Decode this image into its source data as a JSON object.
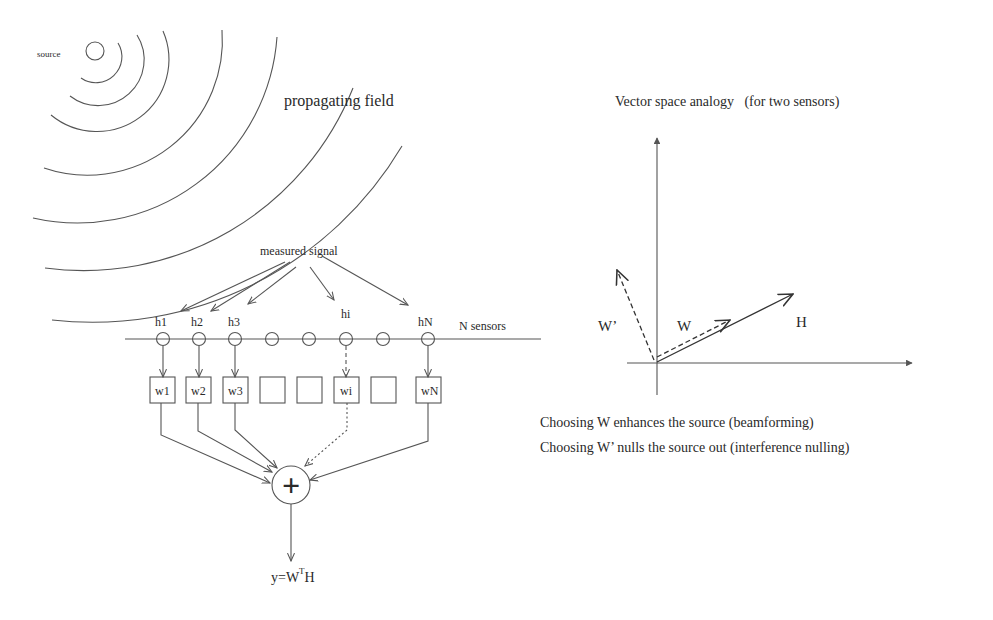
{
  "left_panel": {
    "source_label": "source",
    "field_label": "propagating field",
    "measured_label": "measured signal",
    "sensor_array_label": "N sensors",
    "sensors": [
      {
        "x": 163,
        "label": "h1",
        "weight": "w1",
        "path": "solid"
      },
      {
        "x": 199,
        "label": "h2",
        "weight": "w2",
        "path": "solid"
      },
      {
        "x": 235,
        "label": "h3",
        "weight": "w3",
        "path": "solid"
      },
      {
        "x": 272,
        "label": "",
        "weight": "",
        "path": "none"
      },
      {
        "x": 309,
        "label": "",
        "weight": "",
        "path": "none"
      },
      {
        "x": 346,
        "label": "hi",
        "weight": "wi",
        "path": "dashed"
      },
      {
        "x": 383,
        "label": "",
        "weight": "",
        "path": "none"
      },
      {
        "x": 428,
        "label": "hN",
        "weight": "wN",
        "path": "solid"
      }
    ],
    "summer_symbol": "+",
    "output_label_prefix": "y=W",
    "output_label_sup": "T",
    "output_label_suffix": "H"
  },
  "right_panel": {
    "title": "Vector space analogy   (for two sensors)",
    "vectors": [
      {
        "name": "H",
        "style": "solid"
      },
      {
        "name": "W",
        "style": "dashed"
      },
      {
        "name": "W’",
        "style": "dashed"
      }
    ],
    "caption_lines": [
      "Choosing W enhances the source (beamforming)",
      "Choosing W’ nulls the source out (interference nulling)"
    ]
  }
}
